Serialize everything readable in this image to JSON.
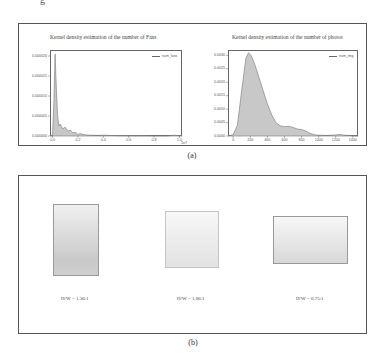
{
  "figure": {
    "panel_a_caption": "(a)",
    "panel_b_caption": "(b)",
    "cut_text": "g"
  },
  "chart_data": [
    {
      "type": "area",
      "title": "Kernel density estimation of the number of  Fans",
      "legend": [
        "num_fans"
      ],
      "legend_position": "upper right",
      "xlabel": "",
      "ylabel": "",
      "x_multiplier": "1e7",
      "xticks": [
        "0.0",
        "0.2",
        "0.4",
        "0.6",
        "0.8",
        "1.0"
      ],
      "yticks": [
        "0.000020",
        "0.000015",
        "0.000010",
        "0.000005",
        "0.000000"
      ],
      "xlim": [
        -0.02,
        1.02
      ],
      "ylim": [
        0,
        2.15e-05
      ],
      "grid": false,
      "fill_color": "#c8c8c8",
      "line_color": "#777777",
      "series": [
        {
          "name": "num_fans",
          "x": [
            -0.02,
            0.0,
            0.01,
            0.02,
            0.03,
            0.04,
            0.05,
            0.06,
            0.08,
            0.1,
            0.12,
            0.14,
            0.16,
            0.18,
            0.2,
            0.22,
            0.25,
            0.3,
            0.35,
            0.4,
            0.5,
            0.6,
            0.7,
            0.8,
            0.9,
            0.97,
            1.0,
            1.02
          ],
          "values": [
            0,
            1e-07,
            8e-06,
            2.05e-05,
            1.2e-05,
            5e-06,
            2.5e-06,
            3e-06,
            1.8e-06,
            2.2e-06,
            1.2e-06,
            1.5e-06,
            8e-07,
            9e-07,
            4e-07,
            6e-07,
            3e-07,
            2e-07,
            1.5e-07,
            2e-07,
            1e-07,
            5e-08,
            5e-08,
            3e-08,
            3e-08,
            2e-07,
            5e-08,
            0
          ]
        }
      ]
    },
    {
      "type": "area",
      "title": "Kernel density estimation of the number of  photos",
      "legend": [
        "num_img"
      ],
      "legend_position": "upper right",
      "xlabel": "",
      "ylabel": "",
      "xticks": [
        "0",
        "200",
        "400",
        "600",
        "800",
        "1000",
        "1200",
        "1400"
      ],
      "yticks": [
        "0.0030",
        "0.0025",
        "0.0020",
        "0.0015",
        "0.0010",
        "0.0005",
        "0.0000"
      ],
      "xlim": [
        -60,
        1460
      ],
      "ylim": [
        0,
        0.0032
      ],
      "grid": false,
      "fill_color": "#c8c8c8",
      "line_color": "#777777",
      "series": [
        {
          "name": "num_img",
          "x": [
            -60,
            0,
            50,
            100,
            150,
            180,
            210,
            250,
            300,
            350,
            400,
            450,
            500,
            550,
            600,
            650,
            700,
            750,
            800,
            850,
            900,
            950,
            1000,
            1100,
            1200,
            1250,
            1300,
            1400,
            1460
          ],
          "values": [
            0,
            5e-05,
            0.0004,
            0.0017,
            0.0029,
            0.0031,
            0.003,
            0.0027,
            0.0022,
            0.0017,
            0.0012,
            0.0008,
            0.0005,
            0.00038,
            0.00035,
            0.00036,
            0.00032,
            0.00026,
            0.00024,
            0.00018,
            0.0001,
            5e-05,
            3e-05,
            2e-05,
            4e-05,
            6e-05,
            3e-05,
            1e-05,
            0
          ]
        }
      ]
    }
  ],
  "panel_b": {
    "items": [
      {
        "label": "H/W = 1.36:1",
        "ratio": 1.36
      },
      {
        "label": "H/W = 1.06:1",
        "ratio": 1.06
      },
      {
        "label": "H/W = 0.75:1",
        "ratio": 0.75
      }
    ]
  }
}
